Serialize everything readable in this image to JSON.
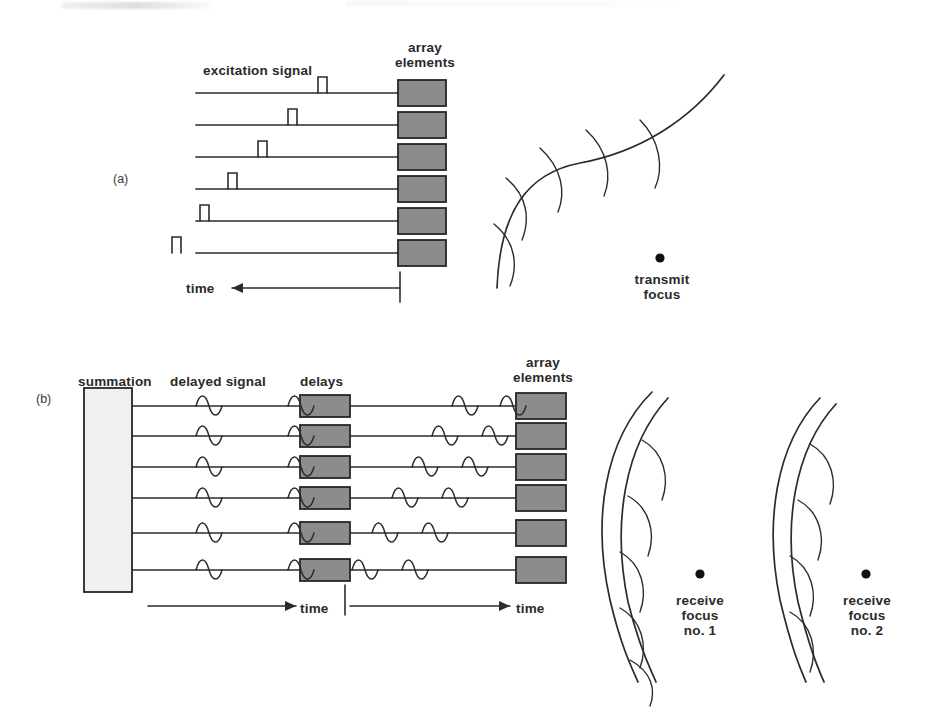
{
  "figure": {
    "panels": [
      {
        "id": "(a)",
        "labels": {
          "excitation_signal": "excitation signal",
          "array_elements": "array\nelements",
          "time": "time",
          "focus": "transmit\nfocus"
        },
        "channel_count": 6,
        "pulse_offsets_px": [
          318,
          288,
          258,
          228,
          200,
          172
        ],
        "time_arrow_direction": "left"
      },
      {
        "id": "(b)",
        "labels": {
          "summation": "summation",
          "sigma": "Σ",
          "delayed_signal": "delayed signal",
          "delays": "delays",
          "array_elements": "array\nelements",
          "time_left": "time",
          "time_right": "time",
          "focus_1": "receive\nfocus\nno. 1",
          "focus_2": "receive\nfocus\nno. 2"
        },
        "channel_count": 6,
        "left_wave_offsets_px": [
          [
            196,
            288
          ],
          [
            196,
            288
          ],
          [
            196,
            288
          ],
          [
            196,
            288
          ],
          [
            196,
            288
          ],
          [
            196,
            288
          ]
        ],
        "right_wave_offsets_px": [
          [
            452,
            500
          ],
          [
            432,
            482
          ],
          [
            412,
            462
          ],
          [
            392,
            442
          ],
          [
            372,
            422
          ],
          [
            352,
            402
          ]
        ],
        "time_arrow_direction": "right"
      }
    ],
    "colors": {
      "element_fill": "#8c8c8c",
      "element_stroke": "#262626",
      "summation_fill": "#f1f1f1",
      "line": "#2b2b2b",
      "text": "#2a2a2a",
      "background": "#ffffff"
    }
  }
}
